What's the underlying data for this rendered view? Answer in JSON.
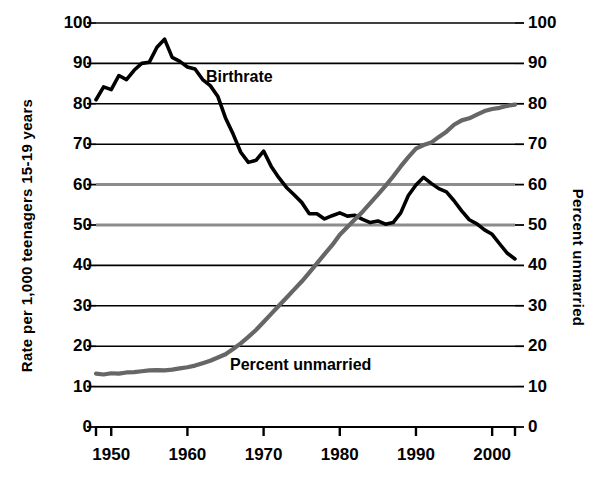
{
  "chart_data": {
    "type": "line",
    "title": "",
    "xlabel": "",
    "ylabel": "Rate per 1,000 teenagers 15-19 years",
    "y2label": "Percent unmarried",
    "xlim": [
      1948,
      2003
    ],
    "ylim": [
      0,
      100
    ],
    "y2lim": [
      0,
      100
    ],
    "grid": true,
    "legend_position": "inline-annotations",
    "x_ticks": [
      1950,
      1960,
      1970,
      1980,
      1990,
      2000
    ],
    "x_tick_labels": [
      "1950",
      "1960",
      "1970",
      "1980",
      "1990",
      "2000"
    ],
    "y_ticks": [
      0,
      10,
      20,
      30,
      40,
      50,
      60,
      70,
      80,
      90,
      100
    ],
    "y_tick_labels": [
      "0",
      "10",
      "20",
      "30",
      "40",
      "50",
      "60",
      "70",
      "80",
      "90",
      "100"
    ],
    "y2_ticks": [
      0,
      10,
      20,
      30,
      40,
      50,
      60,
      70,
      80,
      90,
      100
    ],
    "y2_tick_labels": [
      "0",
      "10",
      "20",
      "30",
      "40",
      "50",
      "60",
      "70",
      "80",
      "90",
      "100"
    ],
    "series": [
      {
        "name": "Birthrate",
        "label": "Birthrate",
        "color": "#000000",
        "axis": "left",
        "x": [
          1948,
          1949,
          1950,
          1951,
          1952,
          1953,
          1954,
          1955,
          1956,
          1957,
          1958,
          1959,
          1960,
          1961,
          1962,
          1963,
          1964,
          1965,
          1966,
          1967,
          1968,
          1969,
          1970,
          1971,
          1972,
          1973,
          1974,
          1975,
          1976,
          1977,
          1978,
          1979,
          1980,
          1981,
          1982,
          1983,
          1984,
          1985,
          1986,
          1987,
          1988,
          1989,
          1990,
          1991,
          1992,
          1993,
          1994,
          1995,
          1996,
          1997,
          1998,
          1999,
          2000,
          2001,
          2002,
          2003
        ],
        "values": [
          81.0,
          84.2,
          83.5,
          87.0,
          86.0,
          88.3,
          90.0,
          90.3,
          94.0,
          96.0,
          91.5,
          90.5,
          89.1,
          88.6,
          86.0,
          84.5,
          81.8,
          76.5,
          72.5,
          68.0,
          65.5,
          66.0,
          68.3,
          64.5,
          61.7,
          59.3,
          57.5,
          55.6,
          52.8,
          52.8,
          51.5,
          52.3,
          53.0,
          52.2,
          52.4,
          51.4,
          50.6,
          51.0,
          50.2,
          50.6,
          53.0,
          57.3,
          59.9,
          61.8,
          60.3,
          59.0,
          58.2,
          56.0,
          53.5,
          51.3,
          50.3,
          48.8,
          47.7,
          45.3,
          43.0,
          41.6
        ]
      },
      {
        "name": "Percent unmarried",
        "label": "Percent unmarried",
        "color": "#666666",
        "axis": "right",
        "x": [
          1948,
          1949,
          1950,
          1951,
          1952,
          1953,
          1954,
          1955,
          1956,
          1957,
          1958,
          1959,
          1960,
          1961,
          1962,
          1963,
          1964,
          1965,
          1966,
          1967,
          1968,
          1969,
          1970,
          1971,
          1972,
          1973,
          1974,
          1975,
          1976,
          1977,
          1978,
          1979,
          1980,
          1981,
          1982,
          1983,
          1984,
          1985,
          1986,
          1987,
          1988,
          1989,
          1990,
          1991,
          1992,
          1993,
          1994,
          1995,
          1996,
          1997,
          1998,
          1999,
          2000,
          2001,
          2002,
          2003
        ],
        "values": [
          13.2,
          13.0,
          13.3,
          13.2,
          13.5,
          13.6,
          13.8,
          14.0,
          14.1,
          14.0,
          14.2,
          14.5,
          14.8,
          15.2,
          15.8,
          16.4,
          17.2,
          18.0,
          19.3,
          20.7,
          22.3,
          24.0,
          26.0,
          28.0,
          30.0,
          32.0,
          34.0,
          36.0,
          38.2,
          40.5,
          42.8,
          45.0,
          47.6,
          49.5,
          51.4,
          53.3,
          55.4,
          57.5,
          59.7,
          62.0,
          64.5,
          66.8,
          68.9,
          69.8,
          70.4,
          71.8,
          73.1,
          74.8,
          75.9,
          76.4,
          77.3,
          78.2,
          78.7,
          79.0,
          79.5,
          79.8
        ]
      }
    ]
  },
  "axes": {
    "left_title": "Rate per 1,000 teenagers 15-19 years",
    "right_title": "Percent unmarried"
  },
  "annotations": {
    "birthrate": "Birthrate",
    "unmarried": "Percent unmarried"
  },
  "colors": {
    "birthrate": "#000000",
    "unmarried": "#666666",
    "gridline_dark": "#000000",
    "gridline_gray": "#8c8c8c",
    "background": "#ffffff"
  }
}
